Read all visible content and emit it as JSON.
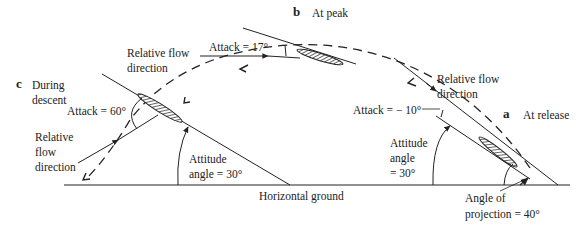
{
  "diagram": {
    "stages": {
      "a": {
        "letter": "a",
        "title": "At release"
      },
      "b": {
        "letter": "b",
        "title": "At peak"
      },
      "c": {
        "letter": "c",
        "title": "During descent"
      }
    },
    "labels": {
      "c_title_line1": "During",
      "c_title_line2": "descent",
      "rel_flow_peak_line1": "Relative flow",
      "rel_flow_peak_line2": "direction",
      "attack_peak": "Attack = 17°",
      "attack_descent": "Attack = 60°",
      "rel_flow_descent_line1": "Relative",
      "rel_flow_descent_line2": "flow",
      "rel_flow_descent_line3": "direction",
      "attitude_descent_line1": "Attitude",
      "attitude_descent_line2": "angle = 30°",
      "ground": "Horizontal ground",
      "rel_flow_release_line1": "Relative flow",
      "rel_flow_release_line2": "direction",
      "attack_release": "Attack = − 10°",
      "attitude_release_line1": "Attitude",
      "attitude_release_line2": "angle",
      "attitude_release_line3": "= 30°",
      "projection_line1": "Angle of",
      "projection_line2": "projection  = 40°"
    },
    "values": {
      "attack_at_release_deg": -10,
      "attack_at_peak_deg": 17,
      "attack_during_descent_deg": 60,
      "attitude_angle_deg": 30,
      "angle_of_projection_deg": 40
    },
    "colors": {
      "line": "#222222",
      "background": "#ffffff"
    }
  }
}
